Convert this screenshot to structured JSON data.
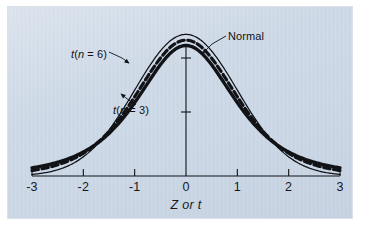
{
  "figure": {
    "panel_color": "#c9d5e4",
    "background_color": "#ffffff",
    "ink_color": "#111317"
  },
  "axis": {
    "title": "Z or t",
    "tick_labels": [
      "-3",
      "-2",
      "-1",
      "0",
      "1",
      "2",
      "3"
    ],
    "y_tick_count": 2
  },
  "labels": {
    "normal": "Normal",
    "t6_prefix": "t",
    "t6_body": "(n = 6)",
    "t6_n": "n",
    "t3_prefix": "t",
    "t3_body": "(n = 3)",
    "t3_n": "n"
  },
  "chart_data": {
    "type": "line",
    "title": "",
    "xlabel": "Z or t",
    "ylabel": "",
    "xlim": [
      -3,
      3
    ],
    "ylim": [
      0,
      0.4
    ],
    "grid": false,
    "legend": "annotated-callouts",
    "x_ticks": [
      -3,
      -2,
      -1,
      0,
      1,
      2,
      3
    ],
    "x": [
      -3,
      -2.75,
      -2.5,
      -2.25,
      -2,
      -1.75,
      -1.5,
      -1.25,
      -1,
      -0.75,
      -0.5,
      -0.25,
      0,
      0.25,
      0.5,
      0.75,
      1,
      1.25,
      1.5,
      1.75,
      2,
      2.25,
      2.5,
      2.75,
      3
    ],
    "series": [
      {
        "name": "Normal",
        "style": "solid-thin",
        "df": null,
        "peak": 0.3989,
        "values": [
          0.0044,
          0.0091,
          0.0175,
          0.0317,
          0.054,
          0.0863,
          0.1295,
          0.1826,
          0.242,
          0.3011,
          0.3521,
          0.3867,
          0.3989,
          0.3867,
          0.3521,
          0.3011,
          0.242,
          0.1826,
          0.1295,
          0.0863,
          0.054,
          0.0317,
          0.0175,
          0.0091,
          0.0044
        ]
      },
      {
        "name": "t(n = 6)",
        "style": "dashed",
        "df": 6,
        "peak": 0.3827,
        "values": [
          0.0173,
          0.0246,
          0.0349,
          0.0494,
          0.0695,
          0.0969,
          0.1325,
          0.176,
          0.2231,
          0.2681,
          0.3054,
          0.3313,
          0.3827,
          0.3313,
          0.3054,
          0.2681,
          0.2231,
          0.176,
          0.1325,
          0.0969,
          0.0695,
          0.0494,
          0.0349,
          0.0246,
          0.0173
        ]
      },
      {
        "name": "t(n = 3)",
        "style": "solid-thick",
        "df": 3,
        "peak": 0.3675,
        "values": [
          0.0299,
          0.0387,
          0.0499,
          0.0641,
          0.0816,
          0.1029,
          0.128,
          0.1563,
          0.1865,
          0.2165,
          0.2433,
          0.2637,
          0.3675,
          0.2637,
          0.2433,
          0.2165,
          0.1865,
          0.1563,
          0.128,
          0.1029,
          0.0816,
          0.0641,
          0.0499,
          0.0387,
          0.0299
        ]
      }
    ],
    "annotations": [
      {
        "text": "Normal",
        "points_to": "normal-curve"
      },
      {
        "text": "t(n = 6)",
        "points_to": "t6-curve"
      },
      {
        "text": "t(n = 3)",
        "points_to": "t3-curve"
      }
    ]
  }
}
